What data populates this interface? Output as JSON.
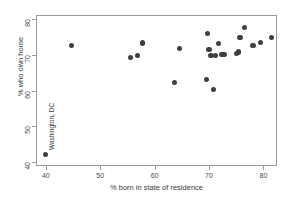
{
  "chart_data": {
    "type": "scatter",
    "title": "",
    "xlabel": "% born in state of residence",
    "ylabel": "% who own home",
    "xlim": [
      38.2,
      82.5
    ],
    "ylim": [
      39.0,
      81.0
    ],
    "xticks": [
      40,
      50,
      60,
      70,
      80
    ],
    "yticks": [
      40,
      50,
      60,
      70,
      80
    ],
    "xtick_labels": [
      "40",
      "50",
      "60",
      "70",
      "80"
    ],
    "ytick_labels": [
      "40",
      "50",
      "60",
      "70",
      "80"
    ],
    "grid": false,
    "legend": null,
    "marker": {
      "shape": "circle",
      "color": "#3f3f3f",
      "size_px": 5.2
    },
    "annotations": [
      {
        "text": "Washington, DC",
        "rotation": 90,
        "x": 40.5,
        "y": 46.5,
        "points_to": [
          39.8,
          42.5
        ]
      }
    ],
    "points": [
      {
        "x": 39.8,
        "y": 42.5
      },
      {
        "x": 44.6,
        "y": 72.8
      },
      {
        "x": 55.4,
        "y": 69.4
      },
      {
        "x": 56.6,
        "y": 70.0
      },
      {
        "x": 57.6,
        "y": 73.5
      },
      {
        "x": 63.5,
        "y": 62.6
      },
      {
        "x": 64.4,
        "y": 72.0
      },
      {
        "x": 69.3,
        "y": 63.3
      },
      {
        "x": 69.6,
        "y": 76.2
      },
      {
        "x": 69.8,
        "y": 71.7
      },
      {
        "x": 70.2,
        "y": 70.0
      },
      {
        "x": 70.7,
        "y": 60.5
      },
      {
        "x": 71.0,
        "y": 70.0
      },
      {
        "x": 71.6,
        "y": 73.3
      },
      {
        "x": 72.2,
        "y": 70.4
      },
      {
        "x": 72.7,
        "y": 70.4
      },
      {
        "x": 74.8,
        "y": 70.5
      },
      {
        "x": 75.3,
        "y": 71.0
      },
      {
        "x": 75.5,
        "y": 75.1
      },
      {
        "x": 76.3,
        "y": 77.8
      },
      {
        "x": 77.9,
        "y": 72.8
      },
      {
        "x": 79.3,
        "y": 73.7
      },
      {
        "x": 81.3,
        "y": 75.0
      }
    ]
  },
  "axes": {
    "x_title": "% born in state of residence",
    "y_title": "% who own home"
  }
}
